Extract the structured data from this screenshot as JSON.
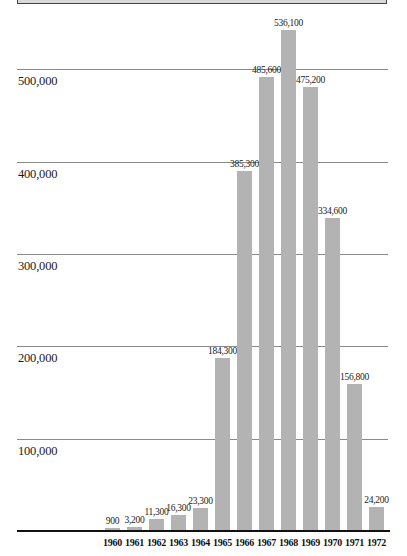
{
  "chart_data": {
    "type": "bar",
    "title": "",
    "xlabel": "",
    "ylabel": "",
    "categories": [
      "1960",
      "1961",
      "1962",
      "1963",
      "1964",
      "1965",
      "1966",
      "1967",
      "1968",
      "1969",
      "1970",
      "1971",
      "1972"
    ],
    "values": [
      900,
      3200,
      11300,
      16300,
      23300,
      184300,
      385300,
      485600,
      536100,
      475200,
      334600,
      156800,
      24200
    ],
    "value_labels": [
      "900",
      "3,200",
      "11,300",
      "16,300",
      "23,300",
      "184,300",
      "385,300",
      "485,600",
      "536,100",
      "475,200",
      "334,600",
      "156,800",
      "24,200"
    ],
    "yticks": [
      {
        "value": 100000,
        "label": "100,000"
      },
      {
        "value": 200000,
        "label": "200,000"
      },
      {
        "value": 300000,
        "label": "300,000"
      },
      {
        "value": 400000,
        "label": "400,000"
      },
      {
        "value": 500000,
        "label": "500,000"
      }
    ],
    "ylim": [
      0,
      550000
    ],
    "grid": true,
    "legend": null,
    "bar_color": "#b3b3b3"
  }
}
